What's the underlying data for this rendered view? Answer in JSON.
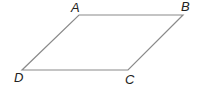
{
  "diagram": {
    "type": "parallelogram",
    "stroke_color": "#8a8a8a",
    "label_color": "#222222",
    "vertices": {
      "A": {
        "label": "A",
        "x": 79,
        "y": 15
      },
      "B": {
        "label": "B",
        "x": 183,
        "y": 15
      },
      "C": {
        "label": "C",
        "x": 128,
        "y": 70
      },
      "D": {
        "label": "D",
        "x": 22,
        "y": 70
      }
    }
  }
}
